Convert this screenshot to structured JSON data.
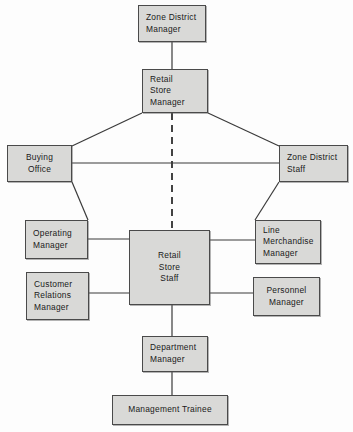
{
  "diagram": {
    "canvas": {
      "width": 353,
      "height": 432
    },
    "colors": {
      "background": "#fdfdfd",
      "node_fill": "#d9d9d7",
      "node_border": "#4a4a4a",
      "edge": "#3a3a3a",
      "text": "#1a1a1a"
    },
    "nodes": [
      {
        "id": "zone-district-manager",
        "lines": [
          "Zone District",
          "Manager"
        ],
        "x": 138,
        "y": 5,
        "w": 68,
        "h": 37,
        "align": "pad-left"
      },
      {
        "id": "retail-store-manager",
        "lines": [
          "Retail",
          "Store",
          "Manager"
        ],
        "x": 142,
        "y": 69,
        "w": 66,
        "h": 44,
        "align": "pad-left"
      },
      {
        "id": "buying-office",
        "lines": [
          "Buying",
          "Office"
        ],
        "x": 7,
        "y": 145,
        "w": 65,
        "h": 37,
        "align": "pad-ctr"
      },
      {
        "id": "zone-district-staff",
        "lines": [
          "Zone District",
          "Staff"
        ],
        "x": 279,
        "y": 145,
        "w": 69,
        "h": 37,
        "align": "pad-left"
      },
      {
        "id": "operating-manager",
        "lines": [
          "Operating",
          "Manager"
        ],
        "x": 25,
        "y": 220,
        "w": 63,
        "h": 39,
        "align": "pad-left"
      },
      {
        "id": "line-merchandise-manager",
        "lines": [
          "Line",
          "Merchandise",
          "Manager"
        ],
        "x": 255,
        "y": 220,
        "w": 66,
        "h": 44,
        "align": "pad-left"
      },
      {
        "id": "retail-store-staff",
        "lines": [
          "Retail",
          "Store",
          "Staff"
        ],
        "x": 129,
        "y": 230,
        "w": 81,
        "h": 75,
        "align": "pad-ctr"
      },
      {
        "id": "customer-relations-manager",
        "lines": [
          "Customer",
          "Relations",
          "Manager"
        ],
        "x": 26,
        "y": 272,
        "w": 63,
        "h": 48,
        "align": "pad-left"
      },
      {
        "id": "personnel-manager",
        "lines": [
          "Personnel",
          "Manager"
        ],
        "x": 253,
        "y": 277,
        "w": 67,
        "h": 39,
        "align": "pad-ctr"
      },
      {
        "id": "department-manager",
        "lines": [
          "Department",
          "Manager"
        ],
        "x": 142,
        "y": 336,
        "w": 66,
        "h": 36,
        "align": "pad-left"
      },
      {
        "id": "management-trainee",
        "lines": [
          "Management Trainee"
        ],
        "x": 112,
        "y": 395,
        "w": 116,
        "h": 30,
        "align": "pad-ctr"
      }
    ],
    "edges": [
      {
        "id": "zdm-to-rsm",
        "style": "solid",
        "points": "172,42 172,69"
      },
      {
        "id": "rsm-to-buying-office",
        "style": "solid",
        "points": "142,113 72,146"
      },
      {
        "id": "rsm-to-zone-district-staff",
        "style": "solid",
        "points": "208,113 279,146"
      },
      {
        "id": "buying-office-to-zone-district-staff",
        "style": "solid",
        "points": "72,163 279,163"
      },
      {
        "id": "buying-office-to-operating-manager",
        "style": "solid",
        "points": "72,182 88,220"
      },
      {
        "id": "zone-district-staff-to-line-merchandise",
        "style": "solid",
        "points": "279,182 255,220"
      },
      {
        "id": "rsm-to-retail-store-staff-dashed",
        "style": "dashed",
        "points": "172,113 172,230"
      },
      {
        "id": "operating-manager-to-staff",
        "style": "solid",
        "points": "88,239 129,239"
      },
      {
        "id": "staff-to-line-merchandise",
        "style": "solid",
        "points": "210,240 255,240"
      },
      {
        "id": "customer-relations-to-staff",
        "style": "solid",
        "points": "89,293 129,293"
      },
      {
        "id": "staff-to-personnel",
        "style": "solid",
        "points": "210,293 253,293"
      },
      {
        "id": "staff-to-department-manager",
        "style": "solid",
        "points": "172,305 172,336"
      },
      {
        "id": "department-manager-to-trainee",
        "style": "solid",
        "points": "172,372 172,395"
      }
    ]
  }
}
